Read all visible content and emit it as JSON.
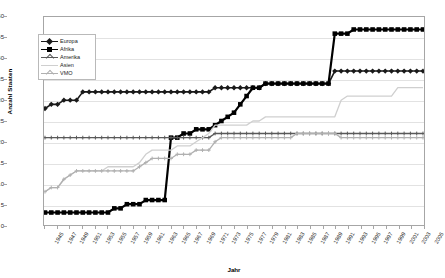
{
  "chart_data": {
    "type": "line",
    "title": "",
    "xlabel": "Jahr",
    "ylabel": "Anzahl Staaten",
    "xlim": [
      1945,
      2005
    ],
    "ylim": [
      0,
      50
    ],
    "ytick_step": 5,
    "xtick_step": 2,
    "grid": true,
    "legend_position": "upper-left-inside",
    "yticks": [
      0,
      5,
      10,
      15,
      20,
      25,
      30,
      35,
      40,
      45,
      50
    ],
    "categories": [
      1945,
      1946,
      1947,
      1948,
      1949,
      1950,
      1951,
      1952,
      1953,
      1954,
      1955,
      1956,
      1957,
      1958,
      1959,
      1960,
      1961,
      1962,
      1963,
      1964,
      1965,
      1966,
      1967,
      1968,
      1969,
      1970,
      1971,
      1972,
      1973,
      1974,
      1975,
      1976,
      1977,
      1978,
      1979,
      1980,
      1981,
      1982,
      1983,
      1984,
      1985,
      1986,
      1987,
      1988,
      1989,
      1990,
      1991,
      1992,
      1993,
      1994,
      1995,
      1996,
      1997,
      1998,
      1999,
      2000,
      2001,
      2002,
      2003,
      2004,
      2005
    ],
    "xticklabels": [
      "1945",
      "1947",
      "1949",
      "1951",
      "1953",
      "1955",
      "1957",
      "1959",
      "1961",
      "1963",
      "1965",
      "1967",
      "1969",
      "1971",
      "1973",
      "1975",
      "1977",
      "1979",
      "1981",
      "1983",
      "1985",
      "1987",
      "1989",
      "1991",
      "1993",
      "1995",
      "1997",
      "1999",
      "2001",
      "2003",
      "2005"
    ],
    "series": [
      {
        "name": "Europa",
        "color": "#1a1a1a",
        "width": 1.6,
        "marker": "diamond",
        "values": [
          28,
          29,
          29,
          30,
          30,
          30,
          32,
          32,
          32,
          32,
          32,
          32,
          32,
          32,
          32,
          32,
          32,
          32,
          32,
          32,
          32,
          32,
          32,
          32,
          32,
          32,
          32,
          33,
          33,
          33,
          33,
          33,
          33,
          33,
          33,
          34,
          34,
          34,
          34,
          34,
          34,
          34,
          34,
          34,
          34,
          34,
          37,
          37,
          37,
          37,
          37,
          37,
          37,
          37,
          37,
          37,
          37,
          37,
          37,
          37,
          37
        ]
      },
      {
        "name": "Afrika",
        "color": "#000000",
        "width": 2.2,
        "marker": "square",
        "values": [
          3,
          3,
          3,
          3,
          3,
          3,
          3,
          3,
          3,
          3,
          3,
          4,
          4,
          5,
          5,
          5,
          6,
          6,
          6,
          6,
          21,
          21,
          22,
          22,
          23,
          23,
          23,
          24,
          25,
          26,
          27,
          29,
          31,
          33,
          33,
          34,
          34,
          34,
          34,
          34,
          34,
          34,
          34,
          34,
          34,
          34,
          46,
          46,
          46,
          47,
          47,
          47,
          47,
          47,
          47,
          47,
          47,
          47,
          47,
          47,
          47
        ]
      },
      {
        "name": "Amerika",
        "color": "#5a5a5a",
        "width": 1.4,
        "marker": "cross",
        "values": [
          21,
          21,
          21,
          21,
          21,
          21,
          21,
          21,
          21,
          21,
          21,
          21,
          21,
          21,
          21,
          21,
          21,
          21,
          21,
          21,
          21,
          21,
          21,
          21,
          21,
          21,
          21,
          22,
          22,
          22,
          22,
          22,
          22,
          22,
          22,
          22,
          22,
          22,
          22,
          22,
          22,
          22,
          22,
          22,
          22,
          22,
          22,
          22,
          22,
          22,
          22,
          22,
          22,
          22,
          22,
          22,
          22,
          22,
          22,
          22,
          22
        ]
      },
      {
        "name": "Asien",
        "color": "#cfcfcf",
        "width": 1.3,
        "marker": "none",
        "values": [
          8,
          9,
          9,
          11,
          12,
          13,
          13,
          13,
          13,
          13,
          14,
          14,
          14,
          14,
          14,
          15,
          17,
          18,
          18,
          18,
          18,
          19,
          19,
          19,
          20,
          21,
          22,
          24,
          24,
          24,
          24,
          24,
          24,
          25,
          25,
          26,
          26,
          26,
          26,
          26,
          26,
          26,
          26,
          26,
          26,
          26,
          26,
          30,
          31,
          31,
          31,
          31,
          31,
          31,
          31,
          31,
          33,
          33,
          33,
          33,
          33
        ]
      },
      {
        "name": "VMO",
        "color": "#b0b0b0",
        "width": 1.3,
        "marker": "cross",
        "values": [
          8,
          9,
          9,
          11,
          12,
          13,
          13,
          13,
          13,
          13,
          13,
          13,
          13,
          13,
          13,
          14,
          15,
          16,
          16,
          16,
          16,
          17,
          17,
          17,
          18,
          18,
          18,
          20,
          21,
          21,
          21,
          21,
          21,
          21,
          21,
          21,
          21,
          21,
          21,
          21,
          22,
          22,
          22,
          22,
          22,
          22,
          22,
          21,
          21,
          21,
          21,
          21,
          21,
          21,
          21,
          21,
          21,
          21,
          21,
          21,
          21
        ]
      }
    ],
    "legend": [
      {
        "label": "Europa"
      },
      {
        "label": "Afrika"
      },
      {
        "label": "Amerika"
      },
      {
        "label": "Asien"
      },
      {
        "label": "VMO"
      }
    ]
  }
}
